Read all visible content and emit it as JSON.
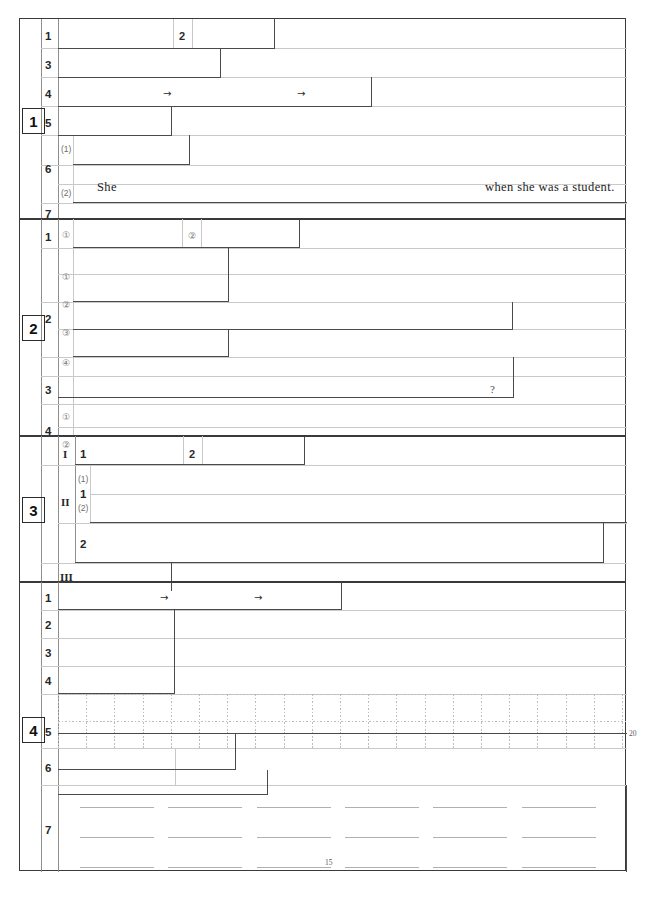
{
  "document": {
    "kind": "answer-sheet",
    "title": "",
    "page_width": 645,
    "page_height": 901,
    "ink_color": "#3a3a3a",
    "rule_color": "#c9c9c9",
    "text_color": "#1b1b1b"
  },
  "sections": [
    {
      "number": "1",
      "rows": [
        {
          "label": "1",
          "sublabels": [
            "",
            ""
          ],
          "markers": [
            "2"
          ]
        },
        {
          "label": "3",
          "sublabels": [],
          "markers": []
        },
        {
          "label": "4",
          "sublabels": [],
          "markers": [
            "→",
            "→"
          ]
        },
        {
          "label": "5",
          "sublabels": [],
          "markers": []
        },
        {
          "label": "6",
          "sublabels": [
            "(1)",
            "(2)"
          ],
          "markers": []
        },
        {
          "label": "7",
          "sublabels": [],
          "markers": []
        }
      ],
      "sentence": {
        "lead": "She",
        "tail": "when she was a student."
      }
    },
    {
      "number": "2",
      "rows": [
        {
          "label": "1",
          "sublabels": [
            "①",
            "②"
          ],
          "markers": []
        },
        {
          "label": "2",
          "sublabels": [
            "①",
            "②",
            "③",
            "④"
          ],
          "markers": []
        },
        {
          "label": "3",
          "sublabels": [],
          "markers": [
            "?"
          ]
        },
        {
          "label": "4",
          "sublabels": [
            "①",
            "②"
          ],
          "markers": []
        }
      ]
    },
    {
      "number": "3",
      "groups": [
        {
          "roman": "I",
          "rows": [
            {
              "label": "1",
              "sublabels": [],
              "markers": [
                "2"
              ]
            }
          ]
        },
        {
          "roman": "II",
          "rows": [
            {
              "label": "1",
              "sublabels": [
                "(1)",
                "(2)"
              ],
              "markers": []
            },
            {
              "label": "2",
              "sublabels": [],
              "markers": []
            }
          ]
        },
        {
          "roman": "III",
          "rows": [
            {
              "label": "",
              "sublabels": [],
              "markers": []
            }
          ]
        }
      ]
    },
    {
      "number": "4",
      "rows": [
        {
          "label": "1",
          "sublabels": [],
          "markers": [
            "→",
            "→"
          ]
        },
        {
          "label": "2",
          "sublabels": [],
          "markers": []
        },
        {
          "label": "3",
          "sublabels": [],
          "markers": []
        },
        {
          "label": "4",
          "sublabels": [],
          "markers": []
        },
        {
          "label": "5",
          "sublabels": [],
          "markers": [],
          "grid": true,
          "count": "20"
        },
        {
          "label": "6",
          "sublabels": [],
          "markers": []
        },
        {
          "label": "7",
          "sublabels": [],
          "markers": [],
          "ruled_lines": 3,
          "count": "15"
        }
      ]
    }
  ]
}
